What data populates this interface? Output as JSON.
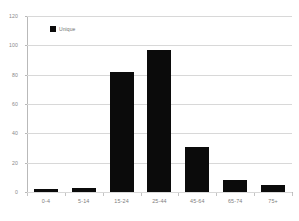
{
  "chart_data": {
    "type": "bar",
    "title": "",
    "subtitle": "",
    "xlabel": "",
    "ylabel": "",
    "categories": [
      "0-4",
      "5-14",
      "15-24",
      "25-44",
      "45-64",
      "65-74",
      "75+"
    ],
    "values": [
      2,
      3,
      82,
      97,
      31,
      8,
      5
    ],
    "series": [
      {
        "name": "Unique",
        "values": [
          2,
          3,
          82,
          97,
          31,
          8,
          5
        ],
        "color": "#0b0b0b"
      }
    ],
    "ylim": [
      0,
      120
    ],
    "yticks": [
      0,
      20,
      40,
      60,
      80,
      100,
      120
    ],
    "ytick_labels": [
      "0",
      "20",
      "40",
      "60",
      "80",
      "100",
      "120"
    ],
    "grid": true,
    "grid_axis": "y",
    "legend": {
      "position": "top-left",
      "entries": [
        {
          "label": "Unique",
          "color": "#0b0b0b",
          "marker": "square"
        }
      ]
    },
    "colors": {
      "bar": "#0b0b0b",
      "grid": "#d8d8d8",
      "axis": "#b9b9b9",
      "tick_text": "#8a8a8a",
      "background": "#ffffff"
    }
  }
}
